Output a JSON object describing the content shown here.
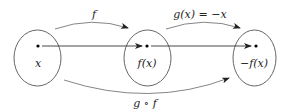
{
  "diagram": {
    "sets": [
      {
        "id": "domain",
        "cx": 37.5,
        "cy": 58,
        "rx": 23.5,
        "ry": 28,
        "point": {
          "x": 38,
          "y": 46
        },
        "label": "x",
        "label_pos": {
          "x": 38,
          "y": 66
        }
      },
      {
        "id": "middle",
        "cx": 147.5,
        "cy": 58,
        "rx": 23.5,
        "ry": 28,
        "point": {
          "x": 147,
          "y": 46
        },
        "label": "f(x)",
        "label_pos": {
          "x": 147,
          "y": 66
        }
      },
      {
        "id": "codomain",
        "cx": 254.5,
        "cy": 58,
        "rx": 21.5,
        "ry": 28,
        "point": {
          "x": 256,
          "y": 46
        },
        "label": "−f(x)",
        "label_pos": {
          "x": 254,
          "y": 66
        }
      }
    ],
    "arrows": [
      {
        "id": "f-arrow",
        "label": "f",
        "label_pos": {
          "x": 94,
          "y": 17
        }
      },
      {
        "id": "g-arrow",
        "label": "g(x) = −x",
        "label_pos": {
          "x": 200,
          "y": 18
        }
      },
      {
        "id": "gf-arrow",
        "label": "g ∘ f",
        "label_pos": {
          "x": 145,
          "y": 106
        }
      }
    ],
    "stroke_color": "#555555",
    "point_color": "#000000"
  }
}
